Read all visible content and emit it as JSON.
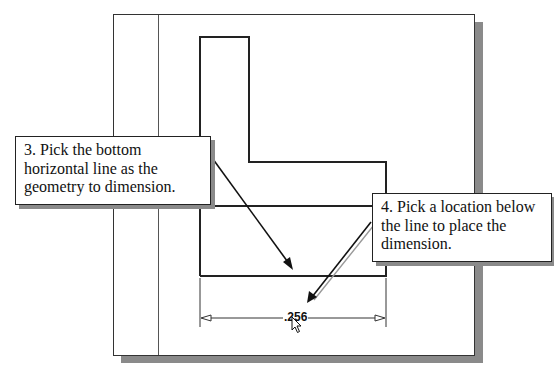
{
  "callouts": [
    {
      "step": 3,
      "text": "3. Pick the bottom horizontal line as the geometry to dimension."
    },
    {
      "step": 4,
      "text": "4. Pick a location below the line to place the dimension."
    }
  ],
  "dimension": {
    "value": ".256"
  },
  "icons": {
    "cursor": "mouse-pointer-icon"
  },
  "colors": {
    "line": "#222222",
    "shadow": "#8a8a8a",
    "background": "#ffffff"
  }
}
